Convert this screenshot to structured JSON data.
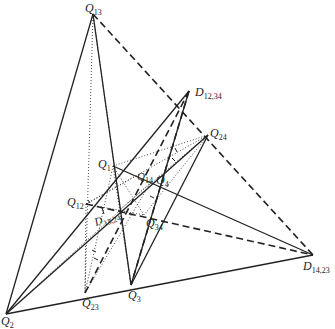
{
  "diagram": {
    "title": "",
    "points": {
      "Q13": {
        "label": "Q",
        "sub": "13",
        "x": 93,
        "y": 14
      },
      "D1234": {
        "label": "D",
        "sub": "12,34",
        "x": 189,
        "y": 91
      },
      "Q24": {
        "label": "Q",
        "sub": "24",
        "x": 208,
        "y": 135
      },
      "Q1": {
        "label": "Q",
        "sub": "1",
        "x": 113,
        "y": 166
      },
      "Q14": {
        "label": "Q",
        "sub": "14",
        "x": 136,
        "y": 176
      },
      "Q4": {
        "label": "Q",
        "sub": "4",
        "x": 151,
        "y": 182
      },
      "Q12": {
        "label": "Q",
        "sub": "12",
        "x": 86,
        "y": 204
      },
      "D1324": {
        "label": "D",
        "sub": "13,24",
        "x": 118,
        "y": 211
      },
      "Q34": {
        "label": "Q",
        "sub": "34",
        "x": 144,
        "y": 215
      },
      "D1423": {
        "label": "D",
        "sub": "14,23",
        "x": 313,
        "y": 255
      },
      "Q23": {
        "label": "Q",
        "sub": "23",
        "x": 85,
        "y": 293
      },
      "Q3": {
        "label": "Q",
        "sub": "3",
        "x": 131,
        "y": 285
      },
      "Q2": {
        "label": "Q",
        "sub": "2",
        "x": 6,
        "y": 314
      }
    },
    "labels": {
      "q13": "Q",
      "q13_sub": "13",
      "d1234": "D",
      "d1234_sub": "12,34",
      "q24": "Q",
      "q24_sub": "24",
      "q1": "Q",
      "q1_sub": "1",
      "q14": "Q",
      "q14_sub": "14",
      "q4": "Q",
      "q4_sub": "4",
      "q12": "Q",
      "q12_sub": "12",
      "d1324": "D",
      "d1324_sub": "13,24",
      "q34": "Q",
      "q34_sub": "34",
      "d1423": "D",
      "d1423_sub": "14,23",
      "q23": "Q",
      "q23_sub": "23",
      "q3": "Q",
      "q3_sub": "3",
      "q2": "Q",
      "q2_sub": "2"
    },
    "line_styles": [
      "solid",
      "dashed",
      "dotted"
    ],
    "colors": {
      "ink": "#222222",
      "background": "#ffffff"
    }
  }
}
